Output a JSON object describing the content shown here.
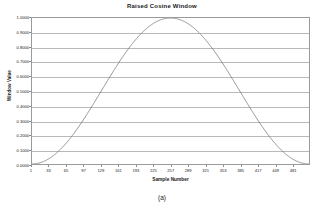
{
  "chart_data": {
    "type": "line",
    "title": "Raised Cosine Window",
    "xlabel": "Sample Number",
    "ylabel": "Window Value",
    "caption": "(a)",
    "grid": true,
    "legend": null,
    "line_color": "#7b7b7b",
    "grid_color": "#b9b9b9",
    "axis_color": "#9a9a9a",
    "xlim": [
      1,
      512
    ],
    "ylim": [
      0.0,
      1.0
    ],
    "xticks": [
      1,
      33,
      65,
      97,
      129,
      161,
      193,
      225,
      257,
      289,
      321,
      353,
      385,
      417,
      449,
      481
    ],
    "xtick_labels": [
      "1",
      "33",
      "65",
      "97",
      "129",
      "161",
      "193",
      "225",
      "257",
      "289",
      "321",
      "353",
      "385",
      "417",
      "449",
      "481"
    ],
    "yticks": [
      0.0,
      0.1,
      0.2,
      0.3,
      0.4,
      0.5,
      0.6,
      0.7,
      0.8,
      0.9,
      1.0
    ],
    "ytick_labels": [
      "0.0000",
      "0.1000",
      "0.2000",
      "0.3000",
      "0.4000",
      "0.5000",
      "0.6000",
      "0.7000",
      "0.8000",
      "0.9000",
      "1.0000"
    ],
    "series": [
      {
        "name": "Raised Cosine Window",
        "x": [
          1,
          17,
          33,
          49,
          65,
          81,
          97,
          113,
          129,
          145,
          161,
          177,
          193,
          209,
          225,
          241,
          257,
          273,
          289,
          305,
          321,
          337,
          353,
          369,
          385,
          401,
          417,
          433,
          449,
          465,
          481,
          497,
          512
        ],
        "values": [
          0.0,
          0.0094,
          0.0374,
          0.0831,
          0.1451,
          0.2216,
          0.3104,
          0.4086,
          0.5133,
          0.621,
          0.7283,
          0.8315,
          0.927,
          0.9843,
          0.9991,
          0.995,
          1.0,
          0.995,
          0.9991,
          0.9843,
          0.927,
          0.8315,
          0.7283,
          0.621,
          0.5133,
          0.4086,
          0.3104,
          0.2216,
          0.1451,
          0.0831,
          0.0374,
          0.0094,
          0.0
        ]
      }
    ]
  }
}
